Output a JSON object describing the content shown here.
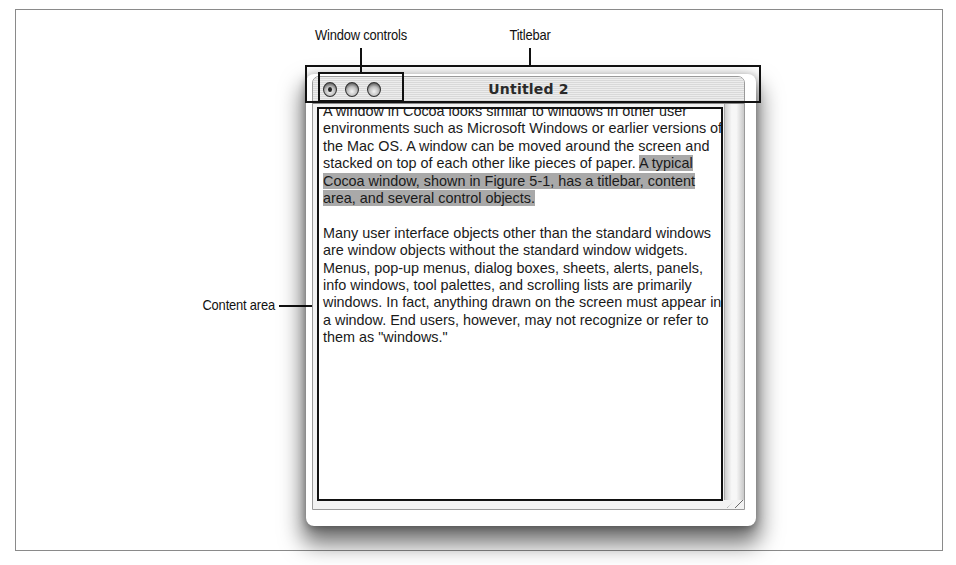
{
  "figure": {
    "callouts": {
      "window_controls": "Window controls",
      "titlebar": "Titlebar",
      "content_area": "Content area"
    }
  },
  "window": {
    "title": "Untitled 2",
    "controls": [
      {
        "name": "close",
        "icon": "close-button-icon"
      },
      {
        "name": "minimize",
        "icon": "minimize-button-icon"
      },
      {
        "name": "zoom",
        "icon": "zoom-button-icon"
      }
    ],
    "content": {
      "paragraph1_plain": "A window in Cocoa looks similar to windows in other user environments such as Microsoft Windows or earlier versions of the Mac OS. A window can be moved around the screen and stacked on top of each other like pieces of paper. ",
      "paragraph1_selected": "A typical Cocoa window, shown in Figure 5-1, has a titlebar, content area, and several control objects.",
      "paragraph2": "Many user interface objects other than the standard windows are window objects without the standard window widgets. Menus, pop-up menus, dialog boxes, sheets, alerts, panels, info windows, tool palettes, and scrolling lists are primarily windows. In fact, anything drawn on the screen must appear in a window. End users, however, may not recognize or refer to them as \"windows.\""
    }
  },
  "colors": {
    "frame": "#8a8a8a",
    "callout_ink": "#111111",
    "selection_highlight": "#a9a9a9",
    "titlebar_stripe_light": "#ededed",
    "titlebar_stripe_dark": "#d9d9d9"
  }
}
